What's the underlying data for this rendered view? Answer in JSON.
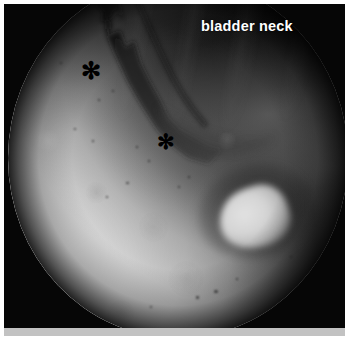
{
  "figure": {
    "kind": "endoscopic-photograph",
    "modality": "cystoscopy",
    "width": 349,
    "height": 338,
    "background_color": "#ffffff",
    "frame": {
      "photo_background": "#070707",
      "bottom_strip_color": "#c2c2c2",
      "margin_px": 4
    }
  },
  "field_of_view": {
    "shape": "circle",
    "surround_color": "#060606",
    "vignette": true,
    "bright_region": "lower-left mucosal surface",
    "dark_region": "upper-right cavity lumen",
    "bright_color": "#d4d4d4",
    "dark_color": "#101010",
    "midtone_color": "#6a6a6a"
  },
  "annotations": {
    "text_labels": [
      {
        "id": "bladder-neck",
        "text": "bladder neck",
        "color": "#ffffff",
        "x": 201,
        "y": 18,
        "font_size_px": 14.5,
        "bold": true
      }
    ],
    "markers": [
      {
        "id": "asterisk-upper",
        "glyph": "✻",
        "color": "#000000",
        "x": 88,
        "y": 72,
        "size_px": 24
      },
      {
        "id": "asterisk-lower",
        "glyph": "✻",
        "color": "#000000",
        "x": 163,
        "y": 143,
        "size_px": 21
      }
    ]
  },
  "specks": [
    {
      "x": 60,
      "y": 62,
      "size": 2.0
    },
    {
      "x": 98,
      "y": 99,
      "size": 2.4
    },
    {
      "x": 112,
      "y": 90,
      "size": 1.8
    },
    {
      "x": 136,
      "y": 146,
      "size": 2.2
    },
    {
      "x": 148,
      "y": 160,
      "size": 2.0
    },
    {
      "x": 126,
      "y": 182,
      "size": 2.6
    },
    {
      "x": 106,
      "y": 196,
      "size": 2.0
    },
    {
      "x": 178,
      "y": 186,
      "size": 1.8
    },
    {
      "x": 188,
      "y": 176,
      "size": 2.2
    },
    {
      "x": 196,
      "y": 296,
      "size": 3.4
    },
    {
      "x": 214,
      "y": 290,
      "size": 3.8
    },
    {
      "x": 236,
      "y": 278,
      "size": 2.2
    },
    {
      "x": 290,
      "y": 256,
      "size": 2.4
    },
    {
      "x": 150,
      "y": 306,
      "size": 1.8
    },
    {
      "x": 74,
      "y": 128,
      "size": 1.8
    },
    {
      "x": 92,
      "y": 140,
      "size": 2.0
    }
  ]
}
